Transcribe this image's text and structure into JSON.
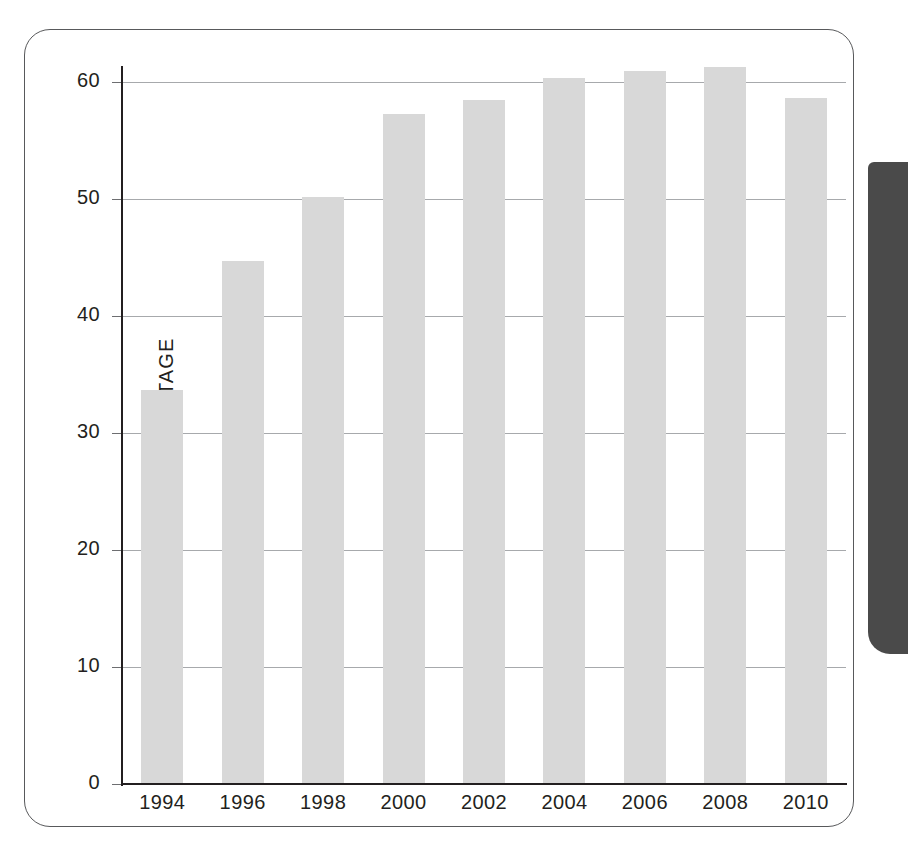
{
  "panel": {
    "border_color": "#58595b",
    "background": "#ffffff"
  },
  "edge_tab": {
    "name": "page-edge-tab",
    "color": "#4a4a4a"
  },
  "chart_data": {
    "type": "bar",
    "title": "",
    "xlabel": "",
    "ylabel": "PERCENTAGE",
    "categories": [
      "1994",
      "1996",
      "1998",
      "2000",
      "2002",
      "2004",
      "2006",
      "2008",
      "2010"
    ],
    "values": [
      33.7,
      44.7,
      50.2,
      57.3,
      58.5,
      60.3,
      60.9,
      61.3,
      58.6
    ],
    "ylim": [
      0,
      62
    ],
    "yticks": [
      0,
      10,
      20,
      30,
      40,
      50,
      60
    ],
    "ytick_labels": [
      "0",
      "10",
      "20",
      "30",
      "40",
      "50",
      "60"
    ],
    "grid": true,
    "gridline_color": "#a7a9ac",
    "bar_color": "#d8d8d8",
    "axis_color": "#231f20",
    "legend": null,
    "legend_position": "none"
  }
}
